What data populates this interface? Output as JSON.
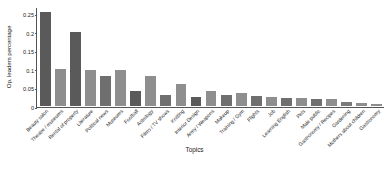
{
  "chart_data": {
    "type": "bar",
    "title": "",
    "xlabel": "Topics",
    "ylabel": "Op. leaders percentage",
    "ylim": [
      0,
      0.27
    ],
    "grid": false,
    "legend": "none",
    "yticks": [
      0,
      0.05,
      0.1,
      0.15,
      0.2,
      0.25
    ],
    "ytick_labels": [
      "0",
      "0.05",
      "0.1",
      "0.15",
      "0.2",
      "0.25"
    ],
    "categories": [
      "Beauty salon",
      "Theatre / museums",
      "Rental of property",
      "Literature",
      "Political news",
      "Museums",
      "Football",
      "Astrology",
      "Films / TV shows",
      "Knitting",
      "Interior Design",
      "Army / Weapons",
      "Makeup",
      "Training / Gym",
      "Flights",
      "Job",
      "Learning English",
      "Pets",
      "Male public",
      "Gastronomy / Recipes",
      "Gardening",
      "Mothers about children",
      "Gastronomy"
    ],
    "values": [
      0.256,
      0.1,
      0.203,
      0.099,
      0.083,
      0.098,
      0.04,
      0.083,
      0.03,
      0.059,
      0.025,
      0.042,
      0.03,
      0.036,
      0.026,
      0.024,
      0.022,
      0.021,
      0.02,
      0.019,
      0.012,
      0.009,
      0.005
    ],
    "bar_colors": [
      "#5a5a5a",
      "#8e8e8e",
      "#5a5a5a",
      "#8e8e8e",
      "#6f6f6f",
      "#8e8e8e",
      "#5a5a5a",
      "#8e8e8e",
      "#6f6f6f",
      "#8e8e8e",
      "#5a5a5a",
      "#8e8e8e",
      "#6f6f6f",
      "#8e8e8e",
      "#6f6f6f",
      "#8e8e8e",
      "#6f6f6f",
      "#8e8e8e",
      "#6f6f6f",
      "#8e8e8e",
      "#7a7a7a",
      "#8e8e8e",
      "#8e8e8e"
    ],
    "axis_color": "#555555"
  }
}
